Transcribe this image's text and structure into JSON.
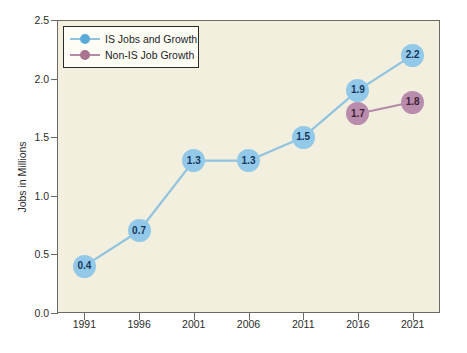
{
  "chart_data": {
    "type": "line",
    "title": "",
    "subtitle": "",
    "xlabel": "",
    "ylabel": "Jobs in Millions",
    "categories": [
      "1991",
      "1996",
      "2001",
      "2006",
      "2011",
      "2016",
      "2021"
    ],
    "x": [
      1991,
      1996,
      2001,
      2006,
      2011,
      2016,
      2021
    ],
    "xlim": [
      1988.5,
      2023.5
    ],
    "ylim": [
      0.0,
      2.5
    ],
    "y_ticks": [
      "0.0",
      "0.5",
      "1.0",
      "1.5",
      "2.0",
      "2.5"
    ],
    "y_tick_values": [
      0.0,
      0.5,
      1.0,
      1.5,
      2.0,
      2.5
    ],
    "grid": false,
    "legend_position": "top-left",
    "series": [
      {
        "name": "IS Jobs and Growth",
        "color": "#93c9e8",
        "line_color": "#8fc3e0",
        "label_color": "#16365c",
        "x": [
          1991,
          1996,
          2001,
          2006,
          2011,
          2016,
          2021
        ],
        "values": [
          0.4,
          0.7,
          1.3,
          1.3,
          1.5,
          1.9,
          2.2
        ],
        "point_labels": [
          "0.4",
          "0.7",
          "1.3",
          "1.3",
          "1.5",
          "1.9",
          "2.2"
        ]
      },
      {
        "name": "Non-IS Job Growth",
        "color": "#b98cae",
        "line_color": "#b58aa8",
        "label_color": "#3e1f35",
        "x": [
          2016,
          2021
        ],
        "values": [
          1.7,
          1.8
        ],
        "point_labels": [
          "1.7",
          "1.8"
        ]
      }
    ]
  },
  "legend": {
    "items": [
      {
        "label": "IS Jobs and Growth",
        "swatch": "is"
      },
      {
        "label": "Non-IS Job Growth",
        "swatch": "nonis"
      }
    ]
  },
  "colors": {
    "plot_background": "#f3efdf",
    "page_background": "#ffffff",
    "axis": "#6b6b63",
    "series_is": "#93c9e8",
    "series_nonis": "#b98cae",
    "tick_text": "#2b2b2b"
  }
}
